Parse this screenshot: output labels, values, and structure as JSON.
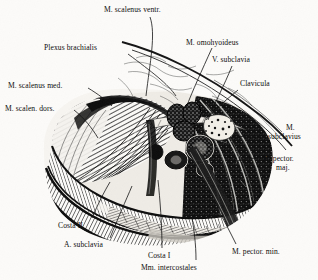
{
  "plate": {
    "kind": "engraved-anatomical-illustration",
    "subject": "Regio subclavia / plexus brachialis dissection",
    "style": "black-and-white steel engraving, hatched",
    "paper_color": "#fcfbf9",
    "ink_color": "#0d0d0d"
  },
  "labels": [
    {
      "id": "scalenus-ventr",
      "text": "M. scalenus ventr.",
      "x": 104,
      "y": 6,
      "align": "left"
    },
    {
      "id": "plexus-brachialis",
      "text": "Plexus brachialis",
      "x": 44,
      "y": 44,
      "align": "left"
    },
    {
      "id": "omohyoideus",
      "text": "M. omohyoideus",
      "x": 186,
      "y": 39,
      "align": "left"
    },
    {
      "id": "v-subclavia",
      "text": "V. subclavia",
      "x": 212,
      "y": 56,
      "align": "left"
    },
    {
      "id": "scalenus-med",
      "text": "M. scalenus med.",
      "x": 8,
      "y": 82,
      "align": "left"
    },
    {
      "id": "clavicula",
      "text": "Clavicula",
      "x": 240,
      "y": 80,
      "align": "left"
    },
    {
      "id": "scalen-dors",
      "text": "M. scalen. dors.",
      "x": 5,
      "y": 105,
      "align": "left"
    },
    {
      "id": "m-subclavius-1",
      "text": "M.",
      "x": 286,
      "y": 124,
      "align": "left"
    },
    {
      "id": "m-subclavius-2",
      "text": "subclavius",
      "x": 268,
      "y": 133,
      "align": "left"
    },
    {
      "id": "pector-maj-1",
      "text": "M. pector.",
      "x": 262,
      "y": 155,
      "align": "left"
    },
    {
      "id": "pector-maj-2",
      "text": "maj.",
      "x": 276,
      "y": 164,
      "align": "left"
    },
    {
      "id": "costa-ii",
      "text": "Costa II",
      "x": 58,
      "y": 222,
      "align": "left"
    },
    {
      "id": "a-subclavia",
      "text": "A. subclavia",
      "x": 64,
      "y": 241,
      "align": "left"
    },
    {
      "id": "costa-i",
      "text": "Costa I",
      "x": 148,
      "y": 252,
      "align": "left"
    },
    {
      "id": "pector-min",
      "text": "M. pector. min.",
      "x": 232,
      "y": 248,
      "align": "left"
    },
    {
      "id": "mm-intercostales",
      "text": "Mm. intercostales",
      "x": 141,
      "y": 264,
      "align": "left"
    }
  ],
  "structures": [
    {
      "id": "scalenus-ventr",
      "name": "M. scalenus ventr."
    },
    {
      "id": "scalenus-med",
      "name": "M. scalenus med."
    },
    {
      "id": "scalenus-dors",
      "name": "M. scalen. dors."
    },
    {
      "id": "plexus-brachialis",
      "name": "Plexus brachialis"
    },
    {
      "id": "omohyoideus",
      "name": "M. omohyoideus"
    },
    {
      "id": "v-subclavia",
      "name": "V. subclavia"
    },
    {
      "id": "a-subclavia",
      "name": "A. subclavia"
    },
    {
      "id": "clavicula",
      "name": "Clavicula"
    },
    {
      "id": "subclavius",
      "name": "M. subclavius"
    },
    {
      "id": "pectoralis-major",
      "name": "M. pector. maj."
    },
    {
      "id": "pectoralis-minor",
      "name": "M. pector. min."
    },
    {
      "id": "costa-i",
      "name": "Costa I"
    },
    {
      "id": "costa-ii",
      "name": "Costa II"
    },
    {
      "id": "intercostales",
      "name": "Mm. intercostales"
    }
  ]
}
